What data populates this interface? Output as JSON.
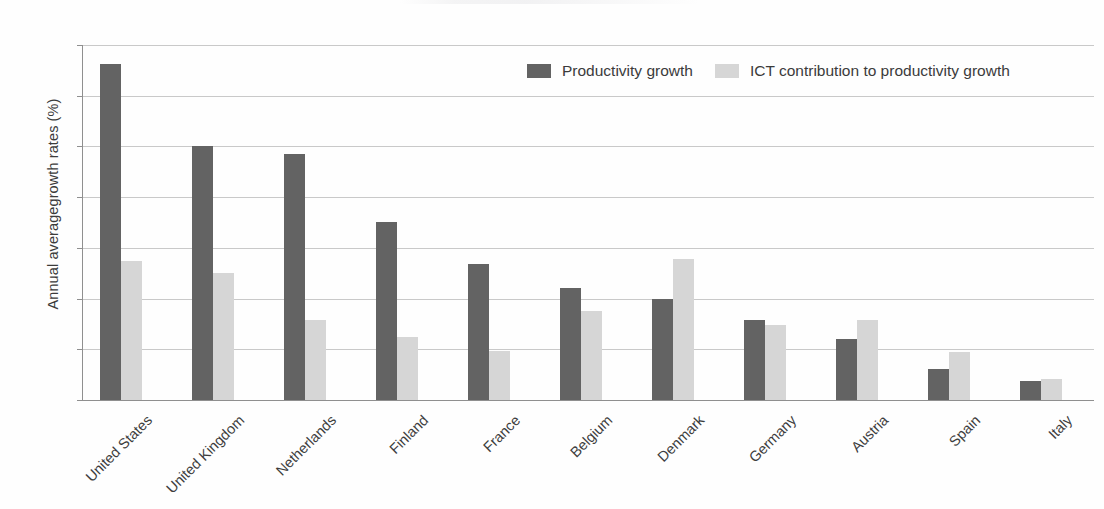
{
  "chart_data": {
    "type": "bar",
    "title": "",
    "subtitle": "",
    "xlabel": "",
    "ylabel": "Annual averagegrowth rates (%)",
    "ylim": [
      0.0,
      3.5
    ],
    "ytick_step": 0.5,
    "ytick_labels": [
      "0.0",
      "0.5",
      "1.0",
      "1.5",
      "2.0",
      "2.5",
      "3.0",
      "3.5"
    ],
    "grid": true,
    "legend_position": "top-center",
    "categories": [
      "United States",
      "United Kingdom",
      "Netherlands",
      "Finland",
      "France",
      "Belgium",
      "Denmark",
      "Germany",
      "Austria",
      "Spain",
      "Italy"
    ],
    "series": [
      {
        "name": "Productivity growth",
        "color": "#636363",
        "values": [
          3.31,
          2.5,
          2.43,
          1.76,
          1.34,
          1.1,
          1.0,
          0.79,
          0.6,
          0.31,
          0.19
        ]
      },
      {
        "name": "ICT contribution to productivity growth",
        "color": "#d6d6d6",
        "values": [
          1.37,
          1.25,
          0.79,
          0.62,
          0.48,
          0.88,
          1.39,
          0.74,
          0.79,
          0.47,
          0.21
        ]
      }
    ]
  },
  "colors": {
    "series_dark": "#636363",
    "series_light": "#d6d6d6",
    "axis": "#8f8f8f",
    "gridline": "#c9c9c9",
    "text": "#3b3b3b",
    "background": "#fefefe"
  }
}
